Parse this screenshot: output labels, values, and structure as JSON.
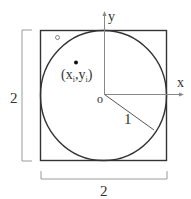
{
  "diagram": {
    "type": "circle-inscribed-in-square",
    "labels": {
      "height_dimension": "2",
      "width_dimension": "2",
      "x_axis": "x",
      "y_axis": "y",
      "origin": "o",
      "radius": "1",
      "point": "(x",
      "point_sub_i": "i",
      "point_comma_y": ",y",
      "point_close": ")"
    },
    "colors": {
      "stroke": "#333333",
      "bracket": "#999999",
      "axis": "#888888"
    }
  }
}
